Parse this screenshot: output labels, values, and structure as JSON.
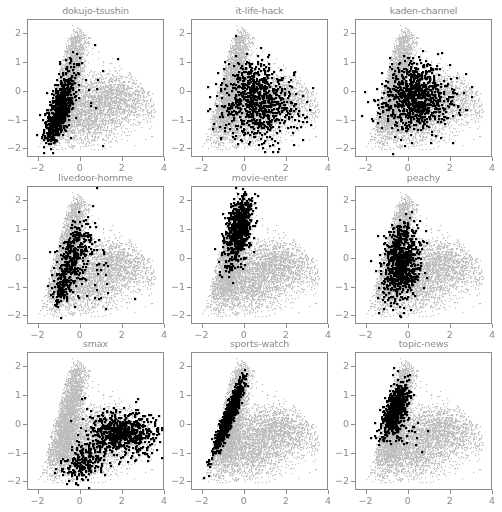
{
  "chart_data": {
    "type": "scatter",
    "layout": "3x3 small multiples",
    "xlim": [
      -2.5,
      4.0
    ],
    "ylim": [
      -2.3,
      2.5
    ],
    "xticks": [
      -2,
      0,
      2,
      4
    ],
    "yticks": [
      -2,
      -1,
      0,
      1,
      2
    ],
    "xtick_labels": [
      "−2",
      "0",
      "2",
      "4"
    ],
    "ytick_labels": [
      "−2",
      "−1",
      "0",
      "1",
      "2"
    ],
    "grid": false,
    "legend": false,
    "colors": {
      "background_points": "#bdbdbd",
      "highlight_points": "#000000",
      "frame": "#8c8c8c",
      "text": "#8a8a8a"
    },
    "background_series": {
      "name": "all documents",
      "description": "grey triangular cloud: left edge from (-1.8,-1.7) to (-0.3,2.3), right lobe extending to x~3.5 around y~-0.3",
      "components": [
        {
          "cx": -0.45,
          "cy": 0.9,
          "sx": 0.35,
          "sy": 0.7,
          "rho": 0.55,
          "n": 1700
        },
        {
          "cx": -0.8,
          "cy": -0.6,
          "sx": 0.45,
          "sy": 0.55,
          "rho": 0.5,
          "n": 1500
        },
        {
          "cx": 1.6,
          "cy": -0.2,
          "sx": 0.9,
          "sy": 0.45,
          "rho": -0.15,
          "n": 1500
        },
        {
          "cx": 0.2,
          "cy": -0.9,
          "sx": 0.8,
          "sy": 0.5,
          "rho": 0.1,
          "n": 1300
        }
      ]
    },
    "panels": [
      {
        "title": "dokujo-tsushin",
        "highlight": [
          {
            "cx": -1.05,
            "cy": -0.75,
            "sx": 0.32,
            "sy": 0.5,
            "rho": 0.55,
            "n": 650
          },
          {
            "cx": -0.6,
            "cy": 0.3,
            "sx": 0.3,
            "sy": 0.45,
            "rho": 0.4,
            "n": 100
          },
          {
            "cx": 0.6,
            "cy": 0.1,
            "sx": 0.8,
            "sy": 0.8,
            "rho": 0.0,
            "n": 15
          }
        ]
      },
      {
        "title": "it-life-hack",
        "highlight": [
          {
            "cx": 0.7,
            "cy": -0.45,
            "sx": 0.9,
            "sy": 0.6,
            "rho": 0.0,
            "n": 700
          },
          {
            "cx": 0.4,
            "cy": 0.5,
            "sx": 0.5,
            "sy": 0.4,
            "rho": 0.0,
            "n": 120
          }
        ]
      },
      {
        "title": "kaden-channel",
        "highlight": [
          {
            "cx": 0.35,
            "cy": -0.25,
            "sx": 0.85,
            "sy": 0.55,
            "rho": 0.05,
            "n": 800
          },
          {
            "cx": 0.3,
            "cy": 0.6,
            "sx": 0.5,
            "sy": 0.3,
            "rho": 0.0,
            "n": 80
          }
        ]
      },
      {
        "title": "livedoor-homme",
        "highlight": [
          {
            "cx": -0.35,
            "cy": 0.0,
            "sx": 0.45,
            "sy": 0.65,
            "rho": 0.6,
            "n": 380
          },
          {
            "cx": -0.95,
            "cy": -1.1,
            "sx": 0.15,
            "sy": 0.3,
            "rho": 0.5,
            "n": 80
          },
          {
            "cx": 0.6,
            "cy": -0.6,
            "sx": 0.7,
            "sy": 0.6,
            "rho": 0.0,
            "n": 40
          }
        ]
      },
      {
        "title": "movie-enter",
        "highlight": [
          {
            "cx": -0.25,
            "cy": 1.2,
            "sx": 0.3,
            "sy": 0.5,
            "rho": 0.3,
            "n": 650
          },
          {
            "cx": -0.6,
            "cy": 0.1,
            "sx": 0.35,
            "sy": 0.4,
            "rho": 0.5,
            "n": 90
          }
        ]
      },
      {
        "title": "peachy",
        "highlight": [
          {
            "cx": -0.35,
            "cy": -0.3,
            "sx": 0.45,
            "sy": 0.6,
            "rho": 0.2,
            "n": 700
          },
          {
            "cx": -0.3,
            "cy": 0.8,
            "sx": 0.35,
            "sy": 0.35,
            "rho": 0.2,
            "n": 120
          }
        ]
      },
      {
        "title": "smax",
        "highlight": [
          {
            "cx": 2.1,
            "cy": -0.3,
            "sx": 0.75,
            "sy": 0.35,
            "rho": -0.1,
            "n": 600
          },
          {
            "cx": 0.1,
            "cy": -1.3,
            "sx": 0.5,
            "sy": 0.35,
            "rho": 0.3,
            "n": 220
          },
          {
            "cx": 1.0,
            "cy": -0.4,
            "sx": 0.5,
            "sy": 0.5,
            "rho": 0.0,
            "n": 100
          }
        ]
      },
      {
        "title": "sports-watch",
        "highlight": [
          {
            "cx": -0.75,
            "cy": 0.3,
            "sx": 0.35,
            "sy": 0.62,
            "rho": 0.93,
            "n": 900
          }
        ]
      },
      {
        "title": "topic-news",
        "highlight": [
          {
            "cx": -0.65,
            "cy": 0.55,
            "sx": 0.3,
            "sy": 0.45,
            "rho": 0.55,
            "n": 650
          },
          {
            "cx": -0.3,
            "cy": -0.4,
            "sx": 0.6,
            "sy": 0.3,
            "rho": 0.0,
            "n": 30
          }
        ]
      }
    ]
  },
  "panel_titles": [
    "dokujo-tsushin",
    "it-life-hack",
    "kaden-channel",
    "livedoor-homme",
    "movie-enter",
    "peachy",
    "smax",
    "sports-watch",
    "topic-news"
  ]
}
